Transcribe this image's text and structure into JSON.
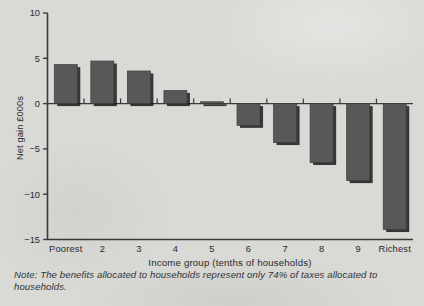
{
  "chart_data": {
    "type": "bar",
    "title": "",
    "subtitle": "",
    "xlabel": "Income group (tenths of households)",
    "ylabel": "Net gain £000s",
    "categories": [
      "Poorest",
      "2",
      "3",
      "4",
      "5",
      "6",
      "7",
      "8",
      "9",
      "Richest"
    ],
    "values": [
      4.3,
      4.7,
      3.6,
      1.45,
      0.2,
      -2.4,
      -4.3,
      -6.5,
      -8.5,
      -13.9
    ],
    "ylim": [
      -15,
      10
    ],
    "yticks": [
      10,
      5,
      0,
      -5,
      -10,
      -15
    ],
    "ytick_labels": [
      "10",
      "5",
      "0",
      "−5",
      "−10",
      "−15"
    ],
    "grid": false,
    "legend": "none",
    "bar_color": "#585858",
    "bar_shadow_color": "#1a1a1a",
    "axis_color": "#3a3a3a",
    "background_color": "#d9d9d6"
  },
  "note": {
    "text": "Note: The benefits allocated to households represent only 74% of taxes allocated to households."
  }
}
